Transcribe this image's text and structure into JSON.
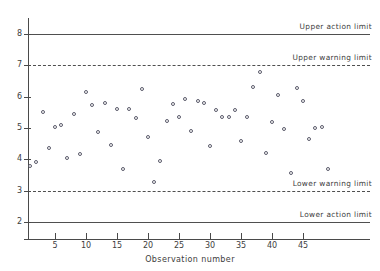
{
  "chart_data": {
    "type": "scatter",
    "title": "",
    "xlabel": "Observation number",
    "ylabel": "",
    "xlim": [
      0,
      50
    ],
    "ylim": [
      1.6,
      8.4
    ],
    "grid": false,
    "legend": "none",
    "xticks": [
      5,
      10,
      15,
      20,
      25,
      30,
      35,
      40,
      45
    ],
    "yticks": [
      2,
      3,
      4,
      5,
      6,
      7,
      8
    ],
    "x": [
      1,
      2,
      3,
      4,
      5,
      6,
      7,
      8,
      9,
      10,
      11,
      12,
      13,
      14,
      15,
      16,
      17,
      18,
      19,
      20,
      21,
      22,
      23,
      24,
      25,
      26,
      27,
      28,
      29,
      30,
      31,
      32,
      33,
      34,
      35,
      36,
      37,
      38,
      39,
      40,
      41,
      42,
      43,
      44,
      45,
      46,
      47,
      48,
      49
    ],
    "values": [
      3.78,
      3.91,
      5.52,
      4.36,
      5.02,
      5.11,
      4.04,
      5.44,
      4.17,
      6.15,
      5.74,
      4.87,
      5.79,
      4.45,
      5.62,
      3.68,
      5.6,
      5.32,
      6.23,
      4.71,
      3.29,
      3.96,
      5.22,
      5.76,
      5.34,
      5.93,
      4.92,
      5.85,
      5.81,
      4.42,
      5.56,
      5.34,
      5.36,
      5.57,
      4.6,
      5.35,
      6.31,
      6.79,
      4.19,
      5.19,
      6.05,
      4.97,
      3.57,
      6.29,
      5.85,
      4.66,
      4.99,
      5.03,
      3.7
    ],
    "reference_lines": [
      {
        "id": "upper-action-limit",
        "label": "Upper action limit",
        "value": 8,
        "style": "solid"
      },
      {
        "id": "upper-warning-limit",
        "label": "Upper warning limit",
        "value": 7,
        "style": "dashed"
      },
      {
        "id": "lower-warning-limit",
        "label": "Lower warning limit",
        "value": 3,
        "style": "dashed"
      },
      {
        "id": "lower-action-limit",
        "label": "Lower action limit",
        "value": 2,
        "style": "solid"
      }
    ],
    "marker": {
      "shape": "circle-open",
      "color": "#5b5b6b",
      "size": 4
    },
    "line_color": "#4f4f4f",
    "axis_color": "#4a4a4a",
    "background": "#ffffff"
  }
}
